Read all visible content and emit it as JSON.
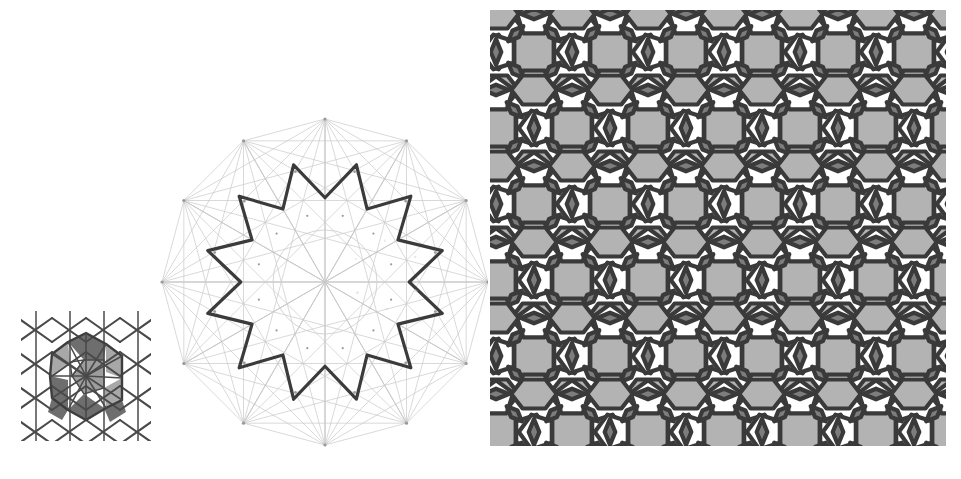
{
  "figure": {
    "caption": "",
    "background_color": "#ffffff",
    "panel_count": 3
  },
  "palette": {
    "stroke_dark": "#3b3b3b",
    "stroke_mid": "#5a5a5a",
    "construction_line": "#c9c9c9",
    "construction_node": "#9a9a9a",
    "tile_white": "#ffffff",
    "tile_light_gray": "#b3b3b3",
    "tile_dark_gray": "#7d7d7d",
    "tile_outline": "#3a3a3a",
    "patch_fill_dark": "#6e6e6e",
    "patch_fill_light": "#a8a8a8",
    "caption_text": "#dcdcdc"
  },
  "panel_a": {
    "name": "triangulated-patch",
    "label": "",
    "description": "small square patch of crosshatched triangular net with shaded decagonal rosette",
    "bounds": {
      "x": 18,
      "y": 308,
      "width": 136,
      "height": 136
    },
    "grid_columns": 4,
    "grid_rows": 4,
    "cell_size": 34,
    "line_color": "#4a4a4a",
    "shaded_regions": [
      {
        "id": "kite-top",
        "fill": "#6e6e6e"
      },
      {
        "id": "kite-left",
        "fill": "#6e6e6e"
      },
      {
        "id": "kite-right",
        "fill": "#a8a8a8"
      },
      {
        "id": "kite-bottom",
        "fill": "#6e6e6e"
      },
      {
        "id": "rosette-core",
        "fill": "#9d9d9d"
      }
    ]
  },
  "panel_b": {
    "name": "twelve-point-star-construction",
    "label": "",
    "description": "bold 12-pointed star rosette over faint dodecagon construction lattice with inscribed circle",
    "bounds": {
      "x": 160,
      "y": 110,
      "width": 330,
      "height": 345
    },
    "center": {
      "cx": 165,
      "cy": 172
    },
    "star_points": 12,
    "outer_radius": 148,
    "inner_radius": 108,
    "star_stroke_color": "#3b3b3b",
    "star_stroke_width": 3.2,
    "construction": {
      "dodecagon_radius": 163,
      "inner_circle_radius": 52,
      "line_color": "#c9c9c9",
      "line_width": 0.7,
      "node_color": "#9a9a9a",
      "node_radius": 1.6,
      "spoke_count": 12,
      "chord_skip_values": [
        2,
        3,
        4,
        5,
        6
      ]
    },
    "tiny_labels": [
      "a",
      "b",
      "c",
      "d",
      "e",
      "f"
    ]
  },
  "panel_c": {
    "name": "pentagon-hexagon-rhombus-tiling",
    "label": "",
    "description": "quasi-periodic tiling of white pentagons, light gray elongated hexagons and dark gray rhombi",
    "bounds": {
      "x": 488,
      "y": 8,
      "width": 460,
      "height": 440
    },
    "unit_cell": 76,
    "columns": 6,
    "rows": 6,
    "tile_types": [
      {
        "type": "pentagon",
        "fill": "#ffffff",
        "count_label": "white pentagon"
      },
      {
        "type": "hexagon",
        "fill": "#b3b3b3",
        "count_label": "light gray hexagon"
      },
      {
        "type": "rhombus",
        "fill": "#7d7d7d",
        "count_label": "dark gray rhombus"
      }
    ],
    "outline_color": "#3a3a3a",
    "outline_width": 4.2
  },
  "chart_data": {
    "type": "table",
    "categories": [
      "panel A",
      "panel B",
      "panel C"
    ],
    "series": [
      {
        "name": "tiles/elements",
        "values": [
          32,
          12,
          108
        ]
      }
    ],
    "annotations": [
      "panel A: triangulated patch with shaded rosette",
      "panel B: 12-point star construction over dodecagonal lattice",
      "panel C: pentagon-hexagon-rhombus tiling"
    ],
    "legend_position": "none",
    "grid": false
  }
}
